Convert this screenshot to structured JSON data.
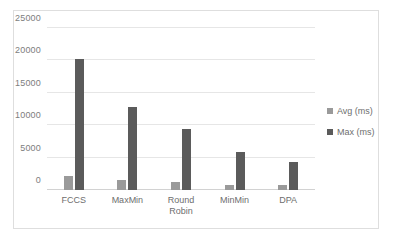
{
  "chart_data": {
    "type": "bar",
    "title": "",
    "subtitle": "",
    "xlabel": "",
    "ylabel": "",
    "categories": [
      "FCCS",
      "MaxMin",
      "Round\nRobin",
      "MinMin",
      "DPA"
    ],
    "series": [
      {
        "name": "Avg (ms)",
        "color": "#9a9a9a",
        "values": [
          2100,
          1600,
          1300,
          800,
          700
        ]
      },
      {
        "name": "Max (ms)",
        "color": "#5b5b5b",
        "values": [
          20200,
          12800,
          9400,
          5900,
          4300
        ]
      }
    ],
    "ylim": [
      0,
      25000
    ],
    "yticks": [
      0,
      5000,
      10000,
      15000,
      20000,
      25000
    ],
    "ytick_labels": [
      "0",
      "5000",
      "10000",
      "15000",
      "20000",
      "25000"
    ],
    "grid": true,
    "legend_position": "right"
  },
  "legend": {
    "items": [
      {
        "label": "Avg (ms)"
      },
      {
        "label": "Max (ms)"
      }
    ]
  }
}
